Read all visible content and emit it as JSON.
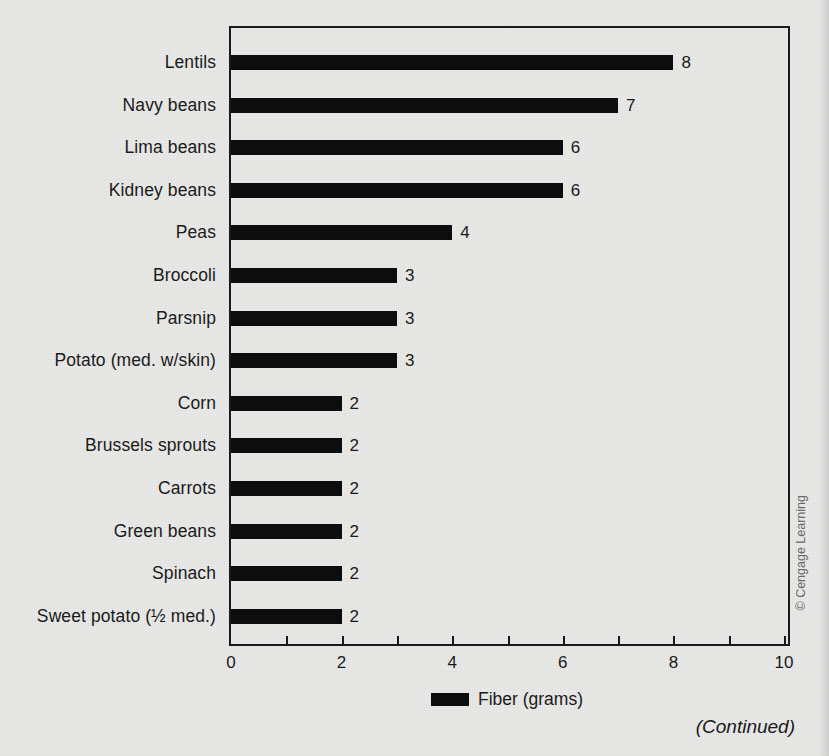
{
  "chart_data": {
    "type": "bar",
    "orientation": "horizontal",
    "title": "",
    "xlabel": "",
    "ylabel": "",
    "xlim": [
      0,
      10
    ],
    "xticks": [
      0,
      1,
      2,
      3,
      4,
      5,
      6,
      7,
      8,
      9,
      10
    ],
    "xtick_labels": [
      "0",
      "",
      "2",
      "",
      "4",
      "",
      "6",
      "",
      "8",
      "",
      "10"
    ],
    "grid": false,
    "legend_position": "bottom-center",
    "categories": [
      "Lentils",
      "Navy beans",
      "Lima beans",
      "Kidney beans",
      "Peas",
      "Broccoli",
      "Parsnip",
      "Potato (med. w/skin)",
      "Corn",
      "Brussels sprouts",
      "Carrots",
      "Green beans",
      "Spinach",
      "Sweet potato (½ med.)"
    ],
    "values": [
      8,
      7,
      6,
      6,
      4,
      3,
      3,
      3,
      2,
      2,
      2,
      2,
      2,
      2
    ],
    "value_labels": [
      "8",
      "7",
      "6",
      "6",
      "4",
      "3",
      "3",
      "3",
      "2",
      "2",
      "2",
      "2",
      "2",
      "2"
    ],
    "series": [
      {
        "name": "Fiber (grams)",
        "color": "#0d0d0d",
        "values": [
          8,
          7,
          6,
          6,
          4,
          3,
          3,
          3,
          2,
          2,
          2,
          2,
          2,
          2
        ]
      }
    ]
  },
  "legend": {
    "label": "Fiber (grams)",
    "swatch_color": "#0d0d0d"
  },
  "credit": {
    "text": "© Cengage Learning"
  },
  "footer": {
    "continued": "(Continued)"
  },
  "colors": {
    "background": "#e9e9e7",
    "bar": "#0d0d0d",
    "axis": "#1a1a1a",
    "text": "#1a1a1a",
    "credit_text": "#6a6a6a"
  }
}
